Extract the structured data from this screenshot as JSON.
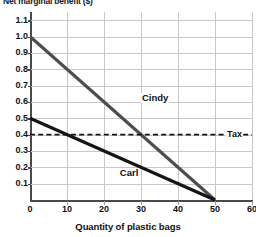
{
  "chart_data": {
    "type": "line",
    "title": "",
    "ylabel": "Net marginal benefit ($)",
    "xlabel": "Quantity of plastic bags",
    "xlim": [
      0,
      60
    ],
    "ylim": [
      0,
      1.15
    ],
    "grid": true,
    "legend_position": "inline-annotations",
    "xticks": [
      "0",
      "10",
      "20",
      "30",
      "40",
      "50",
      "60"
    ],
    "xtick_values": [
      0,
      10,
      20,
      30,
      40,
      50,
      60
    ],
    "yticks": [
      "0.1",
      "0.2",
      "0.3",
      "0.4",
      "0.5",
      "0.6",
      "0.7",
      "0.8",
      "0.9",
      "1.0",
      "1.1"
    ],
    "ytick_values": [
      0.1,
      0.2,
      0.3,
      0.4,
      0.5,
      0.6,
      0.7,
      0.8,
      0.9,
      1.0,
      1.1
    ],
    "series": [
      {
        "name": "Cindy",
        "label": "Cindy",
        "color": "#4d4d4d",
        "style": "solid",
        "x": [
          0,
          50
        ],
        "values": [
          1.0,
          0.0
        ],
        "label_x": 30,
        "label_y": 0.62
      },
      {
        "name": "Carl",
        "label": "Carl",
        "color": "#141414",
        "style": "solid",
        "x": [
          0,
          50
        ],
        "values": [
          0.5,
          0.0
        ],
        "label_x": 24,
        "label_y": 0.16
      },
      {
        "name": "Tax",
        "label": "Tax",
        "color": "#141414",
        "style": "dashed",
        "x": [
          0,
          60
        ],
        "values": [
          0.4,
          0.4
        ],
        "label_x": 53,
        "label_y": 0.4
      }
    ],
    "annotations": [
      {
        "text": "Cindy",
        "x": 30,
        "y": 0.62
      },
      {
        "text": "Carl",
        "x": 24,
        "y": 0.16
      },
      {
        "text": "Tax",
        "x": 53,
        "y": 0.4
      }
    ]
  },
  "colors": {
    "cindy_line": "#4d4d4d",
    "carl_line": "#141414",
    "tax_line": "#141414",
    "gridline": "#c8c8c8",
    "axis": "#4a4a4a",
    "text": "#111111",
    "background": "#ffffff"
  }
}
